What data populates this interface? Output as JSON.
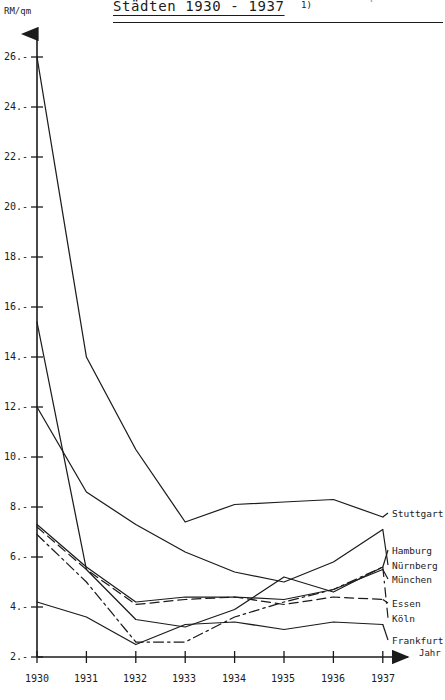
{
  "header": {
    "title": "Städten 1930 - 1937",
    "footnote_marker": "1)",
    "cut_off_line_above": "durchschnittliche Bodenpreise in"
  },
  "axes": {
    "y_unit_label": "RM/qm",
    "x_name_label": "Jahr",
    "y_ticks": [
      "26.-",
      "24.-",
      "22.-",
      "20.-",
      "18.-",
      "16.-",
      "14.-",
      "12.-",
      "10.-",
      "8.-",
      "6.-",
      "4.-",
      "2.-"
    ],
    "y_tick_values": [
      26,
      24,
      22,
      20,
      18,
      16,
      14,
      12,
      10,
      8,
      6,
      4,
      2
    ],
    "x_ticks": [
      "1930",
      "1931",
      "1932",
      "1933",
      "1934",
      "1935",
      "1936",
      "1937"
    ]
  },
  "chart_data": {
    "type": "line",
    "title": "Städten 1930 - 1937",
    "xlabel": "Jahr",
    "ylabel": "RM/qm",
    "ylim": [
      2,
      26
    ],
    "grid": false,
    "legend_position": "right-inline",
    "categories": [
      "1930",
      "1931",
      "1932",
      "1933",
      "1934",
      "1935",
      "1936",
      "1937"
    ],
    "series": [
      {
        "name": "Stuttgart",
        "style": "solid",
        "values": [
          26.0,
          14.0,
          10.3,
          7.4,
          8.1,
          8.2,
          8.3,
          7.6
        ]
      },
      {
        "name": "Hamburg",
        "style": "solid",
        "values": [
          15.4,
          5.5,
          3.5,
          3.2,
          3.9,
          5.2,
          4.6,
          5.6
        ]
      },
      {
        "name": "Nürnberg",
        "style": "solid",
        "values": [
          12.0,
          8.6,
          7.3,
          6.2,
          5.4,
          5.0,
          5.8,
          7.1
        ]
      },
      {
        "name": "München",
        "style": "solid",
        "values": [
          7.3,
          5.6,
          4.2,
          4.4,
          4.4,
          4.3,
          4.7,
          5.5
        ]
      },
      {
        "name": "Essen",
        "style": "dashed",
        "values": [
          7.2,
          5.5,
          4.1,
          4.3,
          4.4,
          4.1,
          4.4,
          4.3
        ]
      },
      {
        "name": "Köln",
        "style": "dash-dot",
        "values": [
          6.9,
          5.0,
          2.6,
          2.6,
          3.6,
          4.2,
          4.7,
          5.6
        ]
      },
      {
        "name": "Frankfurt",
        "style": "solid",
        "values": [
          4.2,
          3.6,
          2.5,
          3.3,
          3.4,
          3.1,
          3.4,
          3.3
        ]
      }
    ]
  },
  "legend_labels": {
    "stuttgart": "Stuttgart",
    "hamburg": "Hamburg",
    "nuernberg": "Nürnberg",
    "muenchen": "München",
    "essen": "Essen",
    "koeln": "Köln",
    "frankfurt": "Frankfurt"
  },
  "colors": {
    "ink": "#1b1b1b",
    "paper": "#ffffff"
  }
}
